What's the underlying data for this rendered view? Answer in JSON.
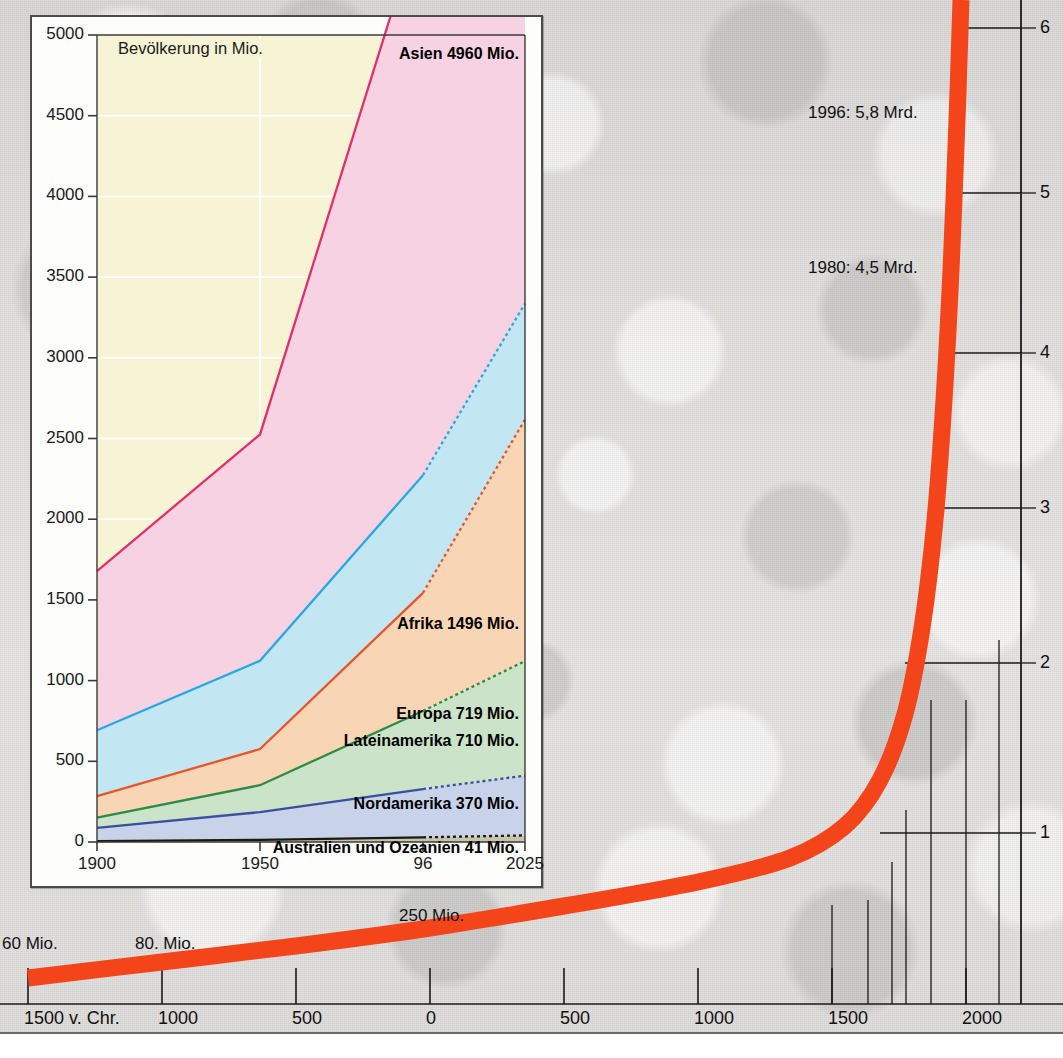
{
  "main_chart": {
    "curve_color": "#F4441A",
    "axis_color": "#1a1a1a",
    "x_axis": {
      "ticks": [
        "1500 v. Chr.",
        "1000",
        "500",
        "0",
        "500",
        "1000",
        "1500",
        "2000"
      ],
      "tick_x": [
        28,
        162,
        296,
        430,
        564,
        698,
        832,
        966
      ]
    },
    "y_axis_right": {
      "unit": "Mrd.",
      "ticks": [
        "1",
        "2",
        "3",
        "4",
        "5",
        "6"
      ],
      "tick_y": [
        833,
        663,
        508,
        353,
        193,
        28
      ]
    },
    "annotations": [
      {
        "text": "60 Mio.",
        "x": 2,
        "y": 934
      },
      {
        "text": "80. Mio.",
        "x": 135,
        "y": 934
      },
      {
        "text": "250 Mio.",
        "x": 399,
        "y": 906
      },
      {
        "text": "1980: 4,5 Mrd.",
        "x": 808,
        "y": 258
      },
      {
        "text": "1996: 5,8 Mrd.",
        "x": 808,
        "y": 103
      }
    ],
    "curve_points": [
      [
        28,
        978
      ],
      [
        162,
        962
      ],
      [
        296,
        946
      ],
      [
        430,
        928
      ],
      [
        564,
        906
      ],
      [
        698,
        882
      ],
      [
        790,
        858
      ],
      [
        845,
        826
      ],
      [
        880,
        780
      ],
      [
        905,
        714
      ],
      [
        922,
        628
      ],
      [
        935,
        520
      ],
      [
        944,
        400
      ],
      [
        951,
        270
      ],
      [
        957,
        120
      ],
      [
        961,
        0
      ]
    ],
    "curve_width": 17
  },
  "inset_chart": {
    "frame": {
      "x": 30,
      "y": 15,
      "w": 513,
      "h": 873
    },
    "plot": {
      "left": 65,
      "top": 18,
      "right": 493,
      "bottom": 825
    },
    "title": "Bevölkerung in Mio.",
    "bg_color": "#F7F4D5",
    "grid_color": "#ffffff",
    "y_ticks": [
      0,
      500,
      1000,
      1500,
      2000,
      2500,
      3000,
      3500,
      4000,
      4500,
      5000
    ],
    "y_max": 5000,
    "x_ticks": [
      {
        "label": "1900",
        "value": 1900,
        "px": 65
      },
      {
        "label": "1950",
        "value": 1950,
        "px": 228
      },
      {
        "label": "96",
        "value": 1996,
        "px": 391
      },
      {
        "label": "2025",
        "value": 2025,
        "px": 493
      }
    ],
    "series_labels": [
      {
        "name": "Asien",
        "text": "Asien 4960 Mio.",
        "x": 487,
        "y": 28,
        "anchor": "end"
      },
      {
        "name": "Afrika",
        "text": "Afrika 1496 Mio.",
        "x": 487,
        "y": 598,
        "anchor": "end"
      },
      {
        "name": "Europa",
        "text": "Europa 719 Mio.",
        "x": 487,
        "y": 688,
        "anchor": "end"
      },
      {
        "name": "Lateinamerika",
        "text": "Lateinamerika 710 Mio.",
        "x": 487,
        "y": 715,
        "anchor": "end"
      },
      {
        "name": "Nordamerika",
        "text": "Nordamerika 370 Mio.",
        "x": 487,
        "y": 778,
        "anchor": "end"
      },
      {
        "name": "Australien und Ozeanien",
        "text": "Australien und Ozeanien 41 Mio.",
        "x": 487,
        "y": 822,
        "anchor": "end"
      }
    ]
  },
  "chart_data": [
    {
      "type": "area",
      "id": "inset-stacked-area",
      "title": "Bevölkerung in Mio.",
      "xlabel": "",
      "ylabel": "Bevölkerung in Mio.",
      "x": [
        1900,
        1950,
        1996,
        2025
      ],
      "xtick_labels": [
        "1900",
        "1950",
        "96",
        "2025"
      ],
      "ylim": [
        0,
        5000
      ],
      "ytick_labels": [
        "0",
        "500",
        "1000",
        "1500",
        "2000",
        "2500",
        "3000",
        "3500",
        "4000",
        "4500",
        "5000"
      ],
      "grid": true,
      "stacked": true,
      "legend": "inline-labels",
      "series": [
        {
          "name": "Australien und Ozeanien",
          "values": [
            6,
            13,
            29,
            41
          ],
          "line_color": "#1a1a14",
          "fill_color": "#c9c4a8",
          "final_label": "Australien und Ozeanien 41 Mio."
        },
        {
          "name": "Nordamerika",
          "values": [
            82,
            172,
            299,
            370
          ],
          "line_color": "#3B4FA0",
          "fill_color": "#C8D3EA",
          "final_label": "Nordamerika 370 Mio."
        },
        {
          "name": "Lateinamerika",
          "values": [
            63,
            167,
            484,
            710
          ],
          "line_color": "#2E8B45",
          "fill_color": "#CBE3C8",
          "final_label": "Lateinamerika 710 Mio."
        },
        {
          "name": "Afrika",
          "values": [
            133,
            224,
            732,
            1496
          ],
          "line_color": "#E8552A",
          "fill_color": "#F8D5B4",
          "final_label": "Afrika 1496 Mio."
        },
        {
          "name": "Europa",
          "values": [
            408,
            547,
            729,
            719
          ],
          "line_color": "#29A8E0",
          "fill_color": "#C3E6F3",
          "final_label": "Europa 719 Mio."
        },
        {
          "name": "Asien",
          "values": [
            987,
            1402,
            3488,
            4960
          ],
          "line_color": "#E0306A",
          "fill_color": "#F6D2E2",
          "final_label": "Asien 4960 Mio."
        }
      ]
    },
    {
      "type": "line",
      "id": "main-world-population",
      "title": "",
      "xlabel": "Jahr",
      "ylabel": "Mrd.",
      "xtick_labels": [
        "1500 v. Chr.",
        "1000",
        "500",
        "0",
        "500",
        "1000",
        "1500",
        "2000"
      ],
      "ytick_labels": [
        "1",
        "2",
        "3",
        "4",
        "5",
        "6"
      ],
      "ylim": [
        0,
        6.4
      ],
      "grid": true,
      "annotations": [
        "60 Mio.",
        "80. Mio.",
        "250 Mio.",
        "1980: 4,5 Mrd.",
        "1996: 5,8 Mrd."
      ],
      "x": [
        -1500,
        -1000,
        -500,
        0,
        500,
        1000,
        1500,
        1750,
        1900,
        1950,
        1980,
        1996,
        2025
      ],
      "values": [
        0.06,
        0.08,
        0.1,
        0.25,
        0.3,
        0.4,
        0.5,
        0.8,
        1.65,
        2.5,
        4.5,
        5.8,
        6.4
      ],
      "line_color": "#F4441A"
    }
  ]
}
